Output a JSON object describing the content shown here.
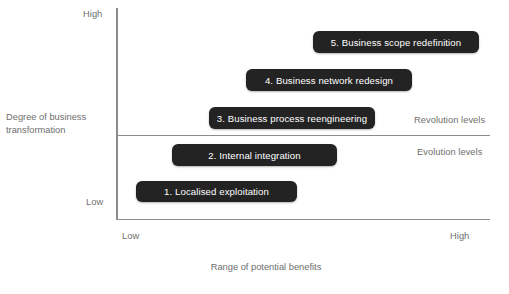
{
  "chart_data": {
    "type": "bar",
    "title": "",
    "xlabel": "Range of potential benefits",
    "ylabel": "Degree of business transformation",
    "x_tick_labels": [
      "Low",
      "High"
    ],
    "y_tick_labels": [
      "Low",
      "High"
    ],
    "grid": false,
    "legend": null,
    "orientation": "horizontal",
    "categories": [
      "1. Localised exploitation",
      "2. Internal integration",
      "3. Business process reengineering",
      "4. Business network redesign",
      "5. Business scope redefinition"
    ],
    "bars": [
      {
        "id": 1,
        "label": "1. Localised exploitation",
        "level": 1,
        "zone": "Evolution levels",
        "x_start": 0.05,
        "x_end": 0.48,
        "y_center": 0.18
      },
      {
        "id": 2,
        "label": "2. Internal integration",
        "level": 2,
        "zone": "Evolution levels",
        "x_start": 0.15,
        "x_end": 0.59,
        "y_center": 0.36
      },
      {
        "id": 3,
        "label": "3. Business process reengineering",
        "level": 3,
        "zone": "Revolution levels",
        "x_start": 0.25,
        "x_end": 0.69,
        "y_center": 0.54
      },
      {
        "id": 4,
        "label": "4. Business network redesign",
        "level": 4,
        "zone": "Revolution levels",
        "x_start": 0.35,
        "x_end": 0.79,
        "y_center": 0.72
      },
      {
        "id": 5,
        "label": "5. Business scope redefinition",
        "level": 5,
        "zone": "Revolution levels",
        "x_start": 0.53,
        "x_end": 0.97,
        "y_center": 0.9
      }
    ],
    "zones": [
      {
        "name": "Revolution levels",
        "position": "above-divider"
      },
      {
        "name": "Evolution levels",
        "position": "below-divider"
      }
    ],
    "divider": {
      "label": "transformation threshold",
      "y": 0.5
    },
    "colors": {
      "bar_fill": "#232323",
      "bar_text": "#ffffff",
      "axis": "#8c8c8c",
      "label_text": "#6e6e6e",
      "background": "#ffffff"
    }
  },
  "axes": {
    "y": {
      "title": "Degree of business\ntransformation",
      "title_line1": "Degree of business",
      "title_line2": "transformation",
      "high_label": "High",
      "low_label": "Low"
    },
    "x": {
      "title": "Range of potential benefits",
      "low_label": "Low",
      "high_label": "High"
    }
  },
  "zones": {
    "revolution_label": "Revolution levels",
    "evolution_label": "Evolution levels"
  },
  "bars": {
    "b1": "1. Localised exploitation",
    "b2": "2. Internal integration",
    "b3": "3. Business process reengineering",
    "b4": "4. Business network redesign",
    "b5": "5. Business scope redefinition"
  }
}
